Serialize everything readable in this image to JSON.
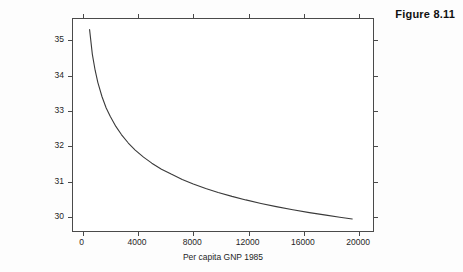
{
  "figure": {
    "caption": "Figure 8.11"
  },
  "chart_data": {
    "type": "line",
    "title": "",
    "subtitle": "",
    "xlabel": "Per capita GNP 1985",
    "ylabel": "birth = f(gnpcap | srmort = 2.49",
    "xlim": [
      -700,
      21000
    ],
    "ylim": [
      29.6,
      35.6
    ],
    "xticks": [
      0,
      4000,
      8000,
      12000,
      16000,
      20000
    ],
    "xtick_labels": [
      "0",
      "4000",
      "8000",
      "12000",
      "16000",
      "20000"
    ],
    "yticks": [
      30,
      31,
      32,
      33,
      34,
      35
    ],
    "ytick_labels": [
      "30",
      "31",
      "32",
      "33",
      "34",
      "35"
    ],
    "grid": false,
    "legend": null,
    "axis_box": true,
    "ticks_all_sides": true,
    "tick_direction": "out",
    "series": [
      {
        "name": "birth",
        "color": "#3a3a3a",
        "x": [
          500,
          700,
          900,
          1100,
          1400,
          1700,
          2000,
          2400,
          2800,
          3300,
          3800,
          4400,
          5000,
          5700,
          6400,
          7200,
          8000,
          8900,
          9800,
          10800,
          11800,
          12900,
          14000,
          15200,
          16400,
          17600,
          18600,
          19500
        ],
        "y": [
          35.3,
          34.6,
          34.15,
          33.8,
          33.4,
          33.08,
          32.84,
          32.56,
          32.33,
          32.09,
          31.89,
          31.69,
          31.52,
          31.35,
          31.21,
          31.06,
          30.93,
          30.8,
          30.69,
          30.58,
          30.48,
          30.38,
          30.29,
          30.2,
          30.12,
          30.05,
          29.99,
          29.94
        ]
      }
    ]
  }
}
